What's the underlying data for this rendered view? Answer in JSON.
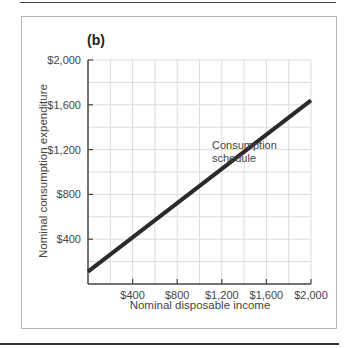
{
  "chart_data": {
    "type": "line",
    "panel_label": "(b)",
    "title": "",
    "xlabel": "Nominal disposable income",
    "ylabel": "Nominal consumption expenditure",
    "xlim": [
      0,
      2000
    ],
    "ylim": [
      0,
      2000
    ],
    "x_ticks": [
      400,
      800,
      1200,
      1600,
      2000
    ],
    "x_tick_labels": [
      "$400",
      "$800",
      "$1,200",
      "$1,600",
      "$2,000"
    ],
    "y_ticks": [
      400,
      800,
      1200,
      1600,
      2000
    ],
    "y_tick_labels": [
      "$400",
      "$800",
      "$1,200",
      "$1,600",
      "$2,000"
    ],
    "grid": true,
    "grid_step": 200,
    "series": [
      {
        "name": "Consumption schedule",
        "x": [
          0,
          400,
          800,
          1200,
          1600,
          2000
        ],
        "values": [
          110,
          416,
          722,
          1028,
          1334,
          1640
        ],
        "color": "#2a2a2a"
      }
    ],
    "annotations": [
      {
        "text": "Consumption schedule",
        "x": 1050,
        "y": 1300
      }
    ],
    "legend": "none"
  }
}
